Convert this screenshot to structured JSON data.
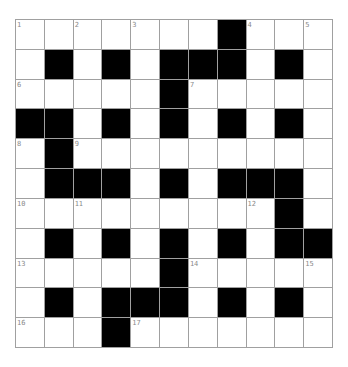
{
  "puzzle": {
    "rows": 11,
    "cols": 11,
    "colors": {
      "block": "#000000",
      "open": "#ffffff",
      "grid_line": "#a0a0a0",
      "number": "#8a8a8a"
    },
    "layout": [
      "....#...#...",
      "x"
    ],
    "grid": [
      [
        "1",
        ".",
        "2",
        ".",
        "3",
        ".",
        ".",
        "#",
        "4",
        ".",
        "5"
      ],
      [
        ".",
        "#",
        ".",
        "#",
        ".",
        "#",
        "#",
        "#",
        ".",
        "#",
        "."
      ],
      [
        "6",
        ".",
        ".",
        ".",
        ".",
        "#",
        "7",
        ".",
        ".",
        ".",
        "."
      ],
      [
        "#",
        "#",
        ".",
        "#",
        ".",
        "#",
        ".",
        "#",
        ".",
        "#",
        "."
      ],
      [
        "8",
        "#",
        "9",
        ".",
        ".",
        ".",
        ".",
        ".",
        ".",
        ".",
        "."
      ],
      [
        ".",
        "#",
        "#",
        "#",
        ".",
        "#",
        ".",
        "#",
        "#",
        "#",
        "."
      ],
      [
        "10",
        ".",
        "11",
        ".",
        ".",
        ".",
        ".",
        ".",
        "12",
        "#",
        "."
      ],
      [
        ".",
        "#",
        ".",
        "#",
        ".",
        "#",
        ".",
        "#",
        ".",
        "#",
        "#"
      ],
      [
        "13",
        ".",
        ".",
        ".",
        ".",
        "#",
        "14",
        ".",
        ".",
        ".",
        "15"
      ],
      [
        ".",
        "#",
        ".",
        "#",
        "#",
        "#",
        ".",
        "#",
        ".",
        "#",
        "."
      ],
      [
        "16",
        ".",
        ".",
        "#",
        "17",
        ".",
        ".",
        ".",
        ".",
        ".",
        "."
      ]
    ]
  }
}
